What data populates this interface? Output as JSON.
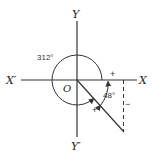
{
  "diagram": {
    "axes": {
      "x_pos_label": "X",
      "x_neg_label": "X′",
      "y_pos_label": "Y",
      "y_neg_label": "Y′",
      "origin_label": "O"
    },
    "angles": {
      "large_angle_label": "312°",
      "small_angle_label": "48°"
    },
    "signs": {
      "x_segment_sign": "+",
      "ray_sign": "+",
      "vertical_sign": "−"
    },
    "colors": {
      "line": "#333333",
      "background": "#ffffff"
    }
  }
}
